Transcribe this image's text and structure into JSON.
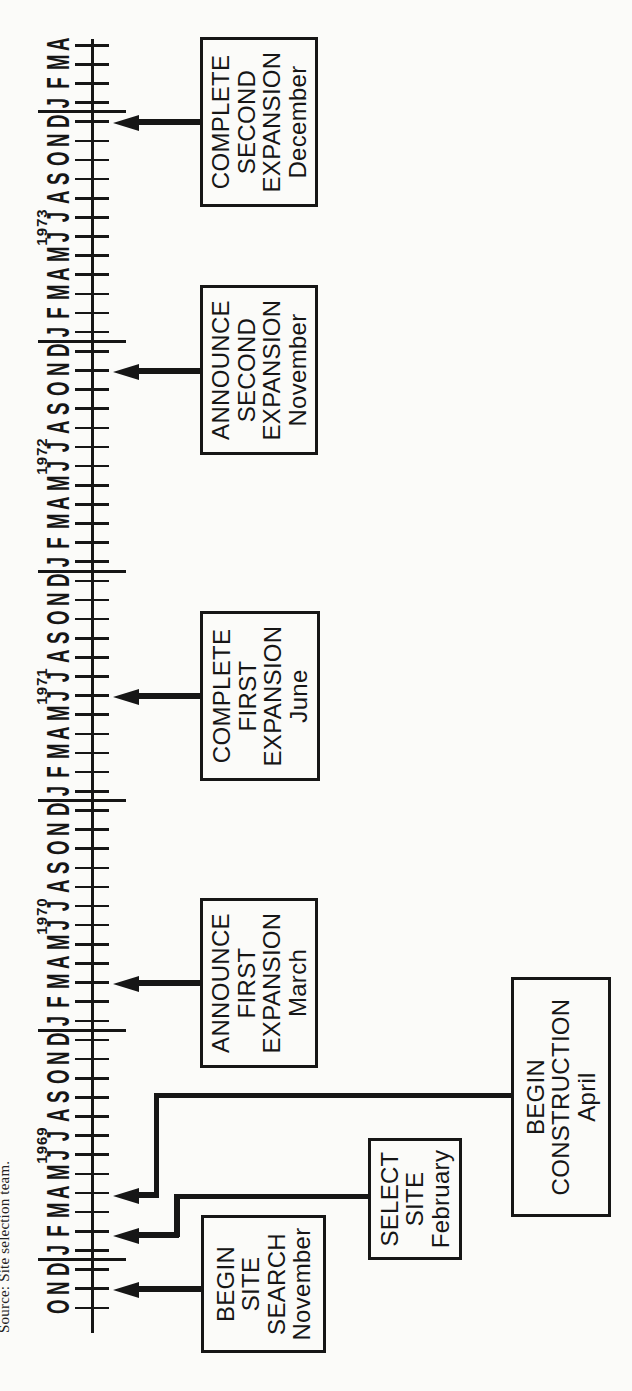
{
  "source_note": "Source: Site selection team.",
  "colors": {
    "ink": "#161616",
    "paper": "#fbfbf9"
  },
  "timeline": {
    "description_visible": "Horizontal month-ruler timeline (scan rotated 90°) from Oct 1968 to Apr 1974 with seven milestone boxes pointing to month ticks",
    "months_sequence": [
      "O",
      "N",
      "D",
      "J",
      "F",
      "M",
      "A",
      "M",
      "J",
      "J",
      "A",
      "S",
      "O",
      "N",
      "D",
      "J",
      "F",
      "M",
      "A",
      "M",
      "J",
      "J",
      "A",
      "S",
      "O",
      "N",
      "D",
      "J",
      "F",
      "M",
      "A",
      "M",
      "J",
      "J",
      "A",
      "S",
      "O",
      "N",
      "D",
      "J",
      "F",
      "M",
      "A",
      "M",
      "J",
      "J",
      "A",
      "S",
      "O",
      "N",
      "D",
      "J",
      "F",
      "M",
      "A",
      "M",
      "J",
      "J",
      "A",
      "S",
      "O",
      "N",
      "D",
      "J",
      "F",
      "M",
      "A"
    ],
    "year_labels": [
      {
        "text": "1969",
        "x": 246
      },
      {
        "text": "1970",
        "x": 475
      },
      {
        "text": "1971",
        "x": 705
      },
      {
        "text": "1972",
        "x": 935
      },
      {
        "text": "1973",
        "x": 1164
      }
    ],
    "year_divider_x": [
      131,
      360.6,
      590.2,
      819.8,
      1049.4,
      1279
    ],
    "geometry": {
      "first_tick_x": 83.2,
      "month_pitch": 19.13,
      "axis_y": 90.5,
      "axis_x1": 58,
      "axis_x2": 1352,
      "tick_y1": 75,
      "tick_y2": 109,
      "divider_y1": 38,
      "divider_y2": 126,
      "arrow_tip_y": 113,
      "arrow_head_len": 26,
      "months_top": 44,
      "year_top": 33
    },
    "events": [
      {
        "id": "begin-site-search",
        "label_lines": [
          "BEGIN",
          "SITE",
          "SEARCH"
        ],
        "month": "November",
        "year_on_axis": "1968",
        "arrow_x": 102,
        "box": {
          "x": 38,
          "y": 201,
          "w": 138,
          "h": 125
        },
        "segments": []
      },
      {
        "id": "select-site",
        "label_lines": [
          "SELECT",
          "SITE"
        ],
        "month": "February",
        "year_on_axis": "1969",
        "arrow_x": 156,
        "arrow_shaft_to": 179,
        "box": {
          "x": 131,
          "y": 368,
          "w": 122,
          "h": 94
        },
        "segments": [
          {
            "x": 153.5,
            "y": 174,
            "w": 43,
            "h": 5.5
          },
          {
            "x": 191.5,
            "y": 174,
            "w": 5.5,
            "h": 196
          }
        ]
      },
      {
        "id": "begin-construction",
        "label_lines": [
          "BEGIN",
          "CONSTRUCTION"
        ],
        "month": "April",
        "year_on_axis": "1969",
        "arrow_x": 196,
        "arrow_shaft_to": 159,
        "box": {
          "x": 174,
          "y": 511,
          "w": 240,
          "h": 100
        },
        "segments": [
          {
            "x": 193.5,
            "y": 153.5,
            "w": 104,
            "h": 5.5
          },
          {
            "x": 292.5,
            "y": 153.5,
            "w": 5.5,
            "h": 359.5
          }
        ]
      },
      {
        "id": "announce-first-expansion",
        "label_lines": [
          "ANNOUNCE",
          "FIRST",
          "EXPANSION"
        ],
        "month": "March",
        "year_on_axis": "1970",
        "arrow_x": 408,
        "box": {
          "x": 323,
          "y": 200,
          "w": 170,
          "h": 118
        }
      },
      {
        "id": "complete-first-expansion",
        "label_lines": [
          "COMPLETE",
          "FIRST",
          "EXPANSION"
        ],
        "month": "June",
        "year_on_axis": "1971",
        "arrow_x": 695,
        "box": {
          "x": 610,
          "y": 200,
          "w": 170,
          "h": 120
        }
      },
      {
        "id": "announce-second-expansion",
        "label_lines": [
          "ANNOUNCE",
          "SECOND",
          "EXPANSION"
        ],
        "month": "November",
        "year_on_axis": "1972",
        "arrow_x": 1020,
        "box": {
          "x": 936,
          "y": 200,
          "w": 170,
          "h": 118
        }
      },
      {
        "id": "complete-second-expansion",
        "label_lines": [
          "COMPLETE",
          "SECOND",
          "EXPANSION"
        ],
        "month": "December",
        "year_on_axis": "1973",
        "arrow_x": 1269,
        "box": {
          "x": 1184,
          "y": 200,
          "w": 170,
          "h": 118
        }
      }
    ]
  }
}
